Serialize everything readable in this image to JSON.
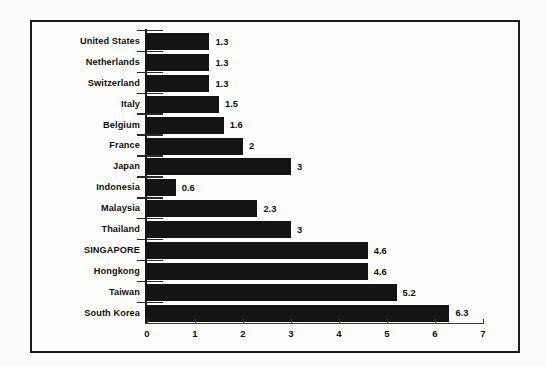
{
  "chart_data": {
    "type": "bar",
    "orientation": "horizontal",
    "title": "",
    "subtitle": "",
    "xlabel": "",
    "ylabel": "",
    "xlim": [
      0,
      7
    ],
    "xticks": [
      "0",
      "1",
      "2",
      "3",
      "4",
      "5",
      "6",
      "7"
    ],
    "grid": false,
    "legend": null,
    "bar_color": "#141414",
    "background_color": "#fdfdfb",
    "border_color": "#1c1c1c",
    "categories": [
      "United States",
      "Netherlands",
      "Switzerland",
      "Italy",
      "Belgium",
      "France",
      "Japan",
      "Indonesia",
      "Malaysia",
      "Thailand",
      "SINGAPORE",
      "Hongkong",
      "Taiwan",
      "South Korea"
    ],
    "values": [
      1.3,
      1.3,
      1.3,
      1.5,
      1.6,
      2,
      3,
      0.6,
      2.3,
      3,
      4.6,
      4.6,
      5.2,
      6.3
    ],
    "value_labels": [
      "1.3",
      "1.3",
      "1.3",
      "1.5",
      "1.6",
      "2",
      "3",
      "0.6",
      "2.3",
      "3",
      "4.6",
      "4.6",
      "5.2",
      "6.3"
    ]
  }
}
